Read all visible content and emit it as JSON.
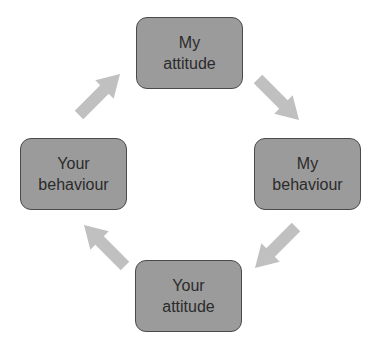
{
  "diagram": {
    "type": "cycle",
    "nodes": [
      {
        "id": "my-attitude",
        "line1": "My",
        "line2": "attitude",
        "x": 136,
        "y": 17,
        "w": 107,
        "h": 72
      },
      {
        "id": "my-behaviour",
        "line1": "My",
        "line2": "behaviour",
        "x": 254,
        "y": 138,
        "w": 107,
        "h": 72
      },
      {
        "id": "your-attitude",
        "line1": "Your",
        "line2": "attitude",
        "x": 135,
        "y": 260,
        "w": 107,
        "h": 72
      },
      {
        "id": "your-behaviour",
        "line1": "Your",
        "line2": "behaviour",
        "x": 20,
        "y": 138,
        "w": 107,
        "h": 72
      }
    ],
    "edges": [
      {
        "from": "my-attitude",
        "to": "my-behaviour"
      },
      {
        "from": "my-behaviour",
        "to": "your-attitude"
      },
      {
        "from": "your-attitude",
        "to": "your-behaviour"
      },
      {
        "from": "your-behaviour",
        "to": "my-attitude"
      }
    ],
    "colors": {
      "node_fill": "#9b9b9b",
      "node_border": "#4a4a4a",
      "arrow": "#c0c0c0",
      "text": "#2b2b2b"
    }
  }
}
